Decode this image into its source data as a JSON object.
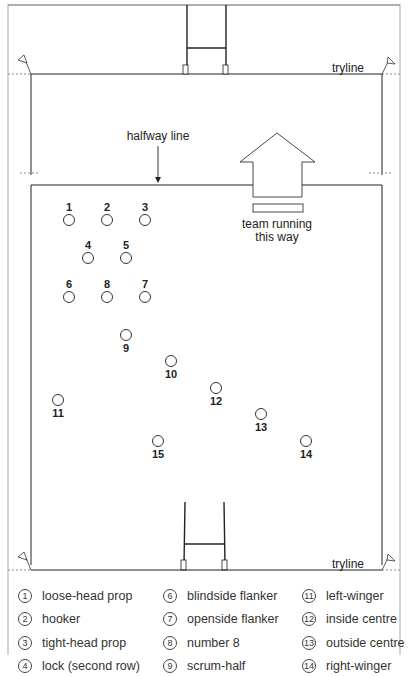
{
  "labels": {
    "tryline_top": "tryline",
    "tryline_bottom": "tryline",
    "halfway": "halfway line",
    "direction_line1": "team running",
    "direction_line2": "this way"
  },
  "players": [
    {
      "n": "1",
      "x": 69,
      "y": 220,
      "label_pos": "above"
    },
    {
      "n": "2",
      "x": 107,
      "y": 220,
      "label_pos": "above"
    },
    {
      "n": "3",
      "x": 145,
      "y": 220,
      "label_pos": "above"
    },
    {
      "n": "4",
      "x": 88,
      "y": 258,
      "label_pos": "above"
    },
    {
      "n": "5",
      "x": 126,
      "y": 258,
      "label_pos": "above"
    },
    {
      "n": "6",
      "x": 69,
      "y": 297,
      "label_pos": "above"
    },
    {
      "n": "8",
      "x": 107,
      "y": 297,
      "label_pos": "above"
    },
    {
      "n": "7",
      "x": 145,
      "y": 297,
      "label_pos": "above"
    },
    {
      "n": "9",
      "x": 126,
      "y": 335,
      "label_pos": "below"
    },
    {
      "n": "10",
      "x": 171,
      "y": 361,
      "label_pos": "below"
    },
    {
      "n": "12",
      "x": 216,
      "y": 388,
      "label_pos": "below"
    },
    {
      "n": "11",
      "x": 58,
      "y": 400,
      "label_pos": "below"
    },
    {
      "n": "13",
      "x": 261,
      "y": 414,
      "label_pos": "below"
    },
    {
      "n": "15",
      "x": 158,
      "y": 441,
      "label_pos": "below"
    },
    {
      "n": "14",
      "x": 306,
      "y": 441,
      "label_pos": "below"
    }
  ],
  "legend": {
    "col1": [
      {
        "n": "1",
        "text": "loose-head prop"
      },
      {
        "n": "2",
        "text": "hooker"
      },
      {
        "n": "3",
        "text": "tight-head prop"
      },
      {
        "n": "4",
        "text": "lock (second row)"
      }
    ],
    "col2": [
      {
        "n": "6",
        "text": "blindside flanker"
      },
      {
        "n": "7",
        "text": "openside flanker"
      },
      {
        "n": "8",
        "text": "number 8"
      },
      {
        "n": "9",
        "text": "scrum-half"
      }
    ],
    "col3": [
      {
        "n": "11",
        "text": "left-winger"
      },
      {
        "n": "12",
        "text": "inside centre"
      },
      {
        "n": "13",
        "text": "outside centre"
      },
      {
        "n": "14",
        "text": "right-winger"
      }
    ]
  },
  "colors": {
    "line": "#222222",
    "frame": "#999999"
  }
}
